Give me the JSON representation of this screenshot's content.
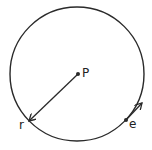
{
  "diagram": {
    "title": "",
    "stroke_color": "#2a2a2a",
    "background": "#ffffff",
    "circle": {
      "cx": 77,
      "cy": 74,
      "r": 67
    },
    "points": [
      {
        "id": "P",
        "label": "P",
        "x": 78,
        "y": 74,
        "label_x": 82,
        "label_y": 77
      },
      {
        "id": "e",
        "label": "e",
        "x": 126,
        "y": 120,
        "label_x": 129,
        "label_y": 128
      }
    ],
    "radius_vector": {
      "label": "r",
      "from": [
        78,
        74
      ],
      "to": [
        29,
        121
      ],
      "label_x": 19,
      "label_y": 129
    },
    "tangent_arrow": {
      "from": [
        126,
        120
      ],
      "to": [
        142,
        103
      ]
    }
  }
}
